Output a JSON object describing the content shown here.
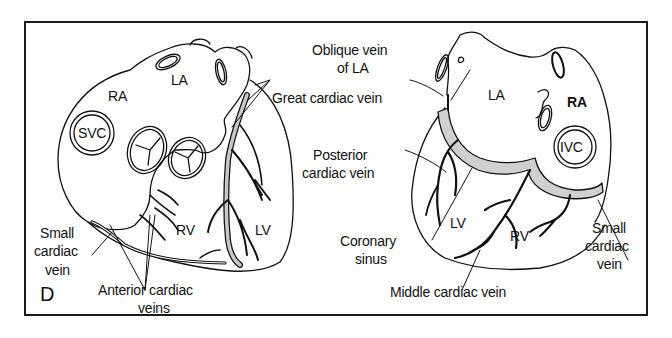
{
  "figure": {
    "panel_letter": "D",
    "frame_color": "#1a1a1a",
    "vein_fill_color": "#c8c8c8",
    "line_color": "#111111"
  },
  "left_heart": {
    "view": "anterior",
    "chambers": {
      "ra": "RA",
      "la": "LA",
      "rv": "RV",
      "lv": "LV",
      "svc": "SVC"
    },
    "labels": {
      "great_cardiac_vein": "Great cardiac vein",
      "small_cardiac_vein_line1": "Small",
      "small_cardiac_vein_line2": "cardiac",
      "small_cardiac_vein_line3": "vein",
      "anterior_cardiac_veins_line1": "Anterior cardiac",
      "anterior_cardiac_veins_line2": "veins"
    }
  },
  "right_heart": {
    "view": "posterior",
    "chambers": {
      "la": "LA",
      "ra": "RA",
      "lv": "LV",
      "rv": "RV",
      "ivc": "IVC"
    },
    "labels": {
      "oblique_vein_line1": "Oblique vein",
      "oblique_vein_line2": "of LA",
      "posterior_cardiac_vein_line1": "Posterior",
      "posterior_cardiac_vein_line2": "cardiac vein",
      "coronary_sinus_line1": "Coronary",
      "coronary_sinus_line2": "sinus",
      "middle_cardiac_vein": "Middle cardiac vein",
      "small_cardiac_vein_line1": "Small",
      "small_cardiac_vein_line2": "cardiac",
      "small_cardiac_vein_line3": "vein"
    }
  }
}
